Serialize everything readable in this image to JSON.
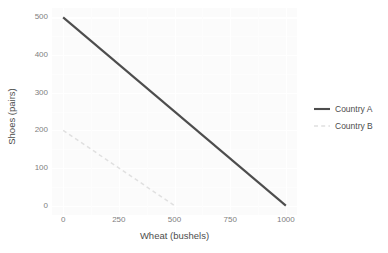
{
  "chart_data": {
    "type": "line",
    "title": "",
    "xlabel": "Wheat (bushels)",
    "ylabel": "Shoes (pairs)",
    "xlim": [
      -50,
      1050
    ],
    "ylim": [
      -25,
      525
    ],
    "xticks": [
      "0",
      "250",
      "500",
      "750",
      "1000"
    ],
    "xtick_values": [
      0,
      250,
      500,
      750,
      1000
    ],
    "yticks": [
      "0",
      "100",
      "200",
      "300",
      "400",
      "500"
    ],
    "ytick_values": [
      0,
      100,
      200,
      300,
      400,
      500
    ],
    "grid": true,
    "legend_position": "right",
    "series": [
      {
        "name": "Country A",
        "x": [
          0,
          1000
        ],
        "y": [
          500,
          0
        ],
        "style": "solid",
        "color": "#4d4d4d",
        "width": 2.1
      },
      {
        "name": "Country B",
        "x": [
          0,
          500
        ],
        "y": [
          200,
          0
        ],
        "style": "dashed",
        "color": "#e0e0e0",
        "width": 1.5
      }
    ]
  },
  "legend": {
    "entries": [
      {
        "label": "Country A"
      },
      {
        "label": "Country B"
      }
    ]
  },
  "colors": {
    "panel_background": "#fbfbfb",
    "gridline": "#ffffff",
    "tick_text": "#808080",
    "axis_title": "#4d4d4d",
    "country_a": "#4d4d4d",
    "country_b": "#e0e0e0"
  }
}
